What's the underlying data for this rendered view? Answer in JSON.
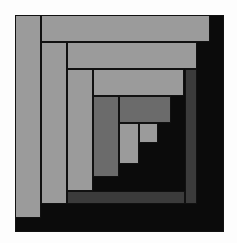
{
  "artwork": {
    "title": "Log cabin quilt block",
    "colors": {
      "background": "#fdfdfd",
      "light": "#9b9b9b",
      "medium": "#6b6b6b",
      "dark": "#3b3b3b",
      "black": "#0b0b0b",
      "border": "#111111"
    },
    "blocks": [
      {
        "name": "outer-black-square",
        "x": 15,
        "y": 15,
        "w": 209,
        "h": 217,
        "tone": "black"
      },
      {
        "name": "right-dark-strip",
        "x": 185,
        "y": 69,
        "w": 12,
        "h": 135,
        "tone": "dark"
      },
      {
        "name": "bottom-dark-strip",
        "x": 67,
        "y": 191,
        "w": 118,
        "h": 13,
        "tone": "dark"
      },
      {
        "name": "left-column-1",
        "x": 15,
        "y": 15,
        "w": 26,
        "h": 203,
        "tone": "light"
      },
      {
        "name": "top-bar-1",
        "x": 41,
        "y": 15,
        "w": 169,
        "h": 27,
        "tone": "light"
      },
      {
        "name": "left-column-2",
        "x": 41,
        "y": 42,
        "w": 26,
        "h": 162,
        "tone": "light"
      },
      {
        "name": "top-bar-2",
        "x": 67,
        "y": 42,
        "w": 130,
        "h": 27,
        "tone": "light"
      },
      {
        "name": "left-column-3",
        "x": 67,
        "y": 69,
        "w": 26,
        "h": 122,
        "tone": "light"
      },
      {
        "name": "top-bar-3",
        "x": 93,
        "y": 69,
        "w": 91,
        "h": 27,
        "tone": "light"
      },
      {
        "name": "left-column-4",
        "x": 93,
        "y": 96,
        "w": 26,
        "h": 81,
        "tone": "medium"
      },
      {
        "name": "top-bar-4",
        "x": 119,
        "y": 96,
        "w": 52,
        "h": 27,
        "tone": "medium"
      },
      {
        "name": "center-column",
        "x": 119,
        "y": 123,
        "w": 20,
        "h": 41,
        "tone": "light"
      },
      {
        "name": "center-square",
        "x": 139,
        "y": 123,
        "w": 19,
        "h": 20,
        "tone": "light"
      }
    ]
  }
}
